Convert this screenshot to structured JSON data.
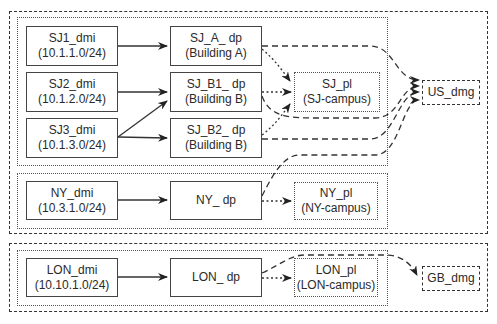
{
  "groups": {
    "us_dmg_group": {
      "style": "dashed"
    },
    "sj_site_group": {
      "style": "dotted"
    },
    "ny_site_group": {
      "style": "dotted"
    },
    "gb_dmg_group": {
      "style": "dashed"
    },
    "lon_site_group": {
      "style": "dotted"
    }
  },
  "nodes": {
    "sj1_dmi": {
      "name": "SJ1_dmi",
      "subnet": "(10.1.1.0/24)"
    },
    "sj2_dmi": {
      "name": "SJ2_dmi",
      "subnet": "(10.1.2.0/24)"
    },
    "sj3_dmi": {
      "name": "SJ3_dmi",
      "subnet": "(10.1.3.0/24)"
    },
    "sj_a_dp": {
      "name": "SJ_A_ dp",
      "sub": "(Building A)"
    },
    "sj_b1_dp": {
      "name": "SJ_B1_ dp",
      "sub": "(Building B)"
    },
    "sj_b2_dp": {
      "name": "SJ_B2_ dp",
      "sub": "(Building B)"
    },
    "sj_pl": {
      "name": "SJ_pl",
      "sub": "(SJ-campus)"
    },
    "us_dmg": {
      "name": "US_dmg"
    },
    "ny_dmi": {
      "name": "NY_dmi",
      "subnet": "(10.3.1.0/24)"
    },
    "ny_dp": {
      "name": "NY_ dp"
    },
    "ny_pl": {
      "name": "NY_pl",
      "sub": "(NY-campus)"
    },
    "lon_dmi": {
      "name": "LON_dmi",
      "subnet": "(10.10.1.0/24)"
    },
    "lon_dp": {
      "name": "LON_ dp"
    },
    "lon_pl": {
      "name": "LON_pl",
      "sub": "(LON-campus)"
    },
    "gb_dmg": {
      "name": "GB_dmg"
    }
  },
  "edges": [
    {
      "from": "SJ1_dmi",
      "to": "SJ_A_ dp",
      "style": "solid"
    },
    {
      "from": "SJ2_dmi",
      "to": "SJ_B1_ dp",
      "style": "solid"
    },
    {
      "from": "SJ3_dmi",
      "to": "SJ_B1_ dp",
      "style": "solid"
    },
    {
      "from": "SJ3_dmi",
      "to": "SJ_B2_ dp",
      "style": "solid"
    },
    {
      "from": "SJ_A_ dp",
      "to": "SJ_pl",
      "style": "dotted"
    },
    {
      "from": "SJ_B1_ dp",
      "to": "SJ_pl",
      "style": "dotted"
    },
    {
      "from": "SJ_B2_ dp",
      "to": "SJ_pl",
      "style": "dotted"
    },
    {
      "from": "SJ_A_ dp",
      "to": "US_dmg",
      "style": "dashed"
    },
    {
      "from": "SJ_B1_ dp",
      "to": "US_dmg",
      "style": "dashed"
    },
    {
      "from": "SJ_B2_ dp",
      "to": "US_dmg",
      "style": "dashed"
    },
    {
      "from": "NY_ dp",
      "to": "US_dmg",
      "style": "dashed"
    },
    {
      "from": "NY_dmi",
      "to": "NY_ dp",
      "style": "solid"
    },
    {
      "from": "NY_ dp",
      "to": "NY_pl",
      "style": "dotted"
    },
    {
      "from": "LON_dmi",
      "to": "LON_ dp",
      "style": "solid"
    },
    {
      "from": "LON_ dp",
      "to": "LON_pl",
      "style": "dotted"
    },
    {
      "from": "LON_ dp",
      "to": "GB_dmg",
      "style": "dashed"
    }
  ],
  "colors": {
    "line": "#333333",
    "background": "#ffffff",
    "text": "#2a2a2a"
  }
}
